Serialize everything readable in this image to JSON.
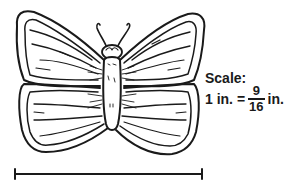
{
  "figure": {
    "scale": {
      "heading": "Scale:",
      "lhs": "1 in. =",
      "numerator": "9",
      "denominator": "16",
      "unit": "in."
    },
    "scale_bar": {
      "description": "horizontal measurement bar spanning the butterfly's wingspan"
    }
  },
  "colors": {
    "ink": "#1a1a1a",
    "background": "#ffffff"
  }
}
